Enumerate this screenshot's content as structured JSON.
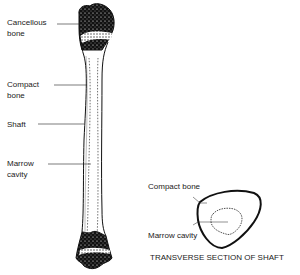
{
  "diagram": {
    "labels": {
      "cancellous_bone": "Cancellous\nbone",
      "compact_bone": "Compact\nbone",
      "shaft": "Shaft",
      "marrow_cavity": "Marrow\ncavity"
    },
    "section": {
      "compact_bone": "Compact bone",
      "marrow_cavity": "Marrow cavity",
      "caption": "TRANSVERSE SECTION OF SHAFT"
    },
    "colors": {
      "ink": "#111111",
      "background": "#ffffff"
    }
  }
}
